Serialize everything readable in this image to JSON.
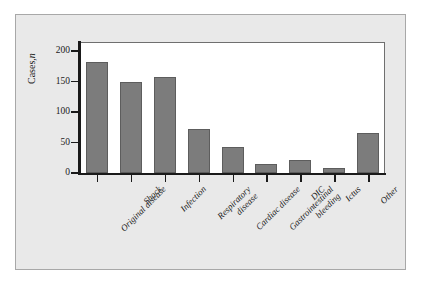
{
  "chart_data": {
    "type": "bar",
    "title": "",
    "xlabel": "",
    "ylabel": "Cases, n",
    "ylabel_main": "Cases,",
    "ylabel_italic": "n",
    "ylim": [
      0,
      215
    ],
    "yticks": [
      0,
      50,
      100,
      150,
      200
    ],
    "ytick_labels": [
      "0",
      "50",
      "100",
      "150",
      "200"
    ],
    "grid": false,
    "legend": "none",
    "bar_color": "#7c7c7c",
    "bar_edge_color": "#5d5d5d",
    "panel_color": "#e9e9e9",
    "plot_background": "#ffffff",
    "categories": [
      "Original disease",
      "Shock",
      "Infection",
      "Respiratory disease",
      "Cardiac disease",
      "Gastrointestinal bleeding",
      "DIC",
      "Ictus",
      "Other"
    ],
    "category_lines": [
      [
        "Original disease"
      ],
      [
        "Shock"
      ],
      [
        "Infection"
      ],
      [
        "Respiratory",
        "disease"
      ],
      [
        "Cardiac disease"
      ],
      [
        "Gastrointestinal",
        "bleeding"
      ],
      [
        "DIC"
      ],
      [
        "Ictus"
      ],
      [
        "Other"
      ]
    ],
    "values": [
      183,
      150,
      157,
      73,
      42,
      15,
      21,
      9,
      65
    ]
  }
}
